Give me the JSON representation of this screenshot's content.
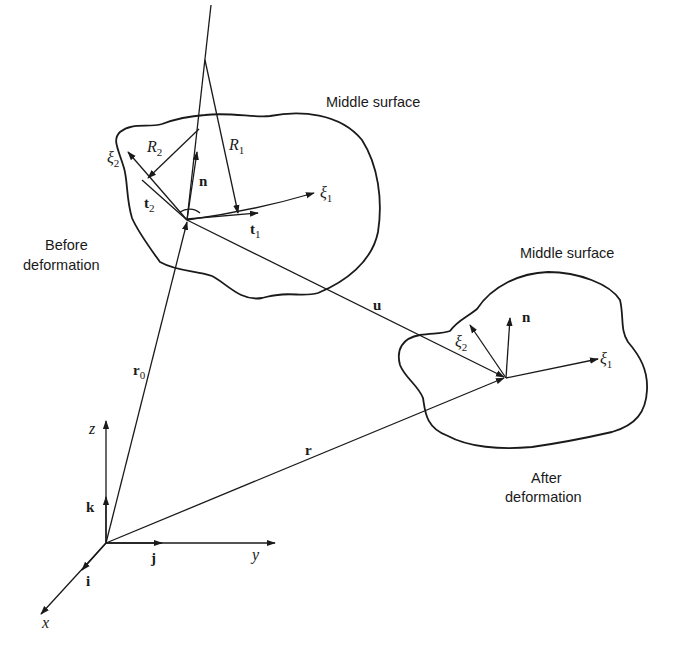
{
  "figure": {
    "labels": {
      "middle_surface_before": "Middle surface",
      "middle_surface_after": "Middle surface",
      "before_line1": "Before",
      "before_line2": "deformation",
      "after_line1": "After",
      "after_line2": "deformation"
    },
    "vectors": {
      "r0": {
        "base": "r",
        "sub": "0"
      },
      "r": {
        "base": "r"
      },
      "u": {
        "base": "u"
      },
      "n_before": {
        "base": "n"
      },
      "n_after": {
        "base": "n"
      },
      "t1": {
        "base": "t",
        "sub": "1"
      },
      "t2": {
        "base": "t",
        "sub": "2"
      },
      "xi1_before": {
        "base": "ξ",
        "sub": "1"
      },
      "xi2_before": {
        "base": "ξ",
        "sub": "2"
      },
      "xi1_after": {
        "base": "ξ",
        "sub": "1"
      },
      "xi2_after": {
        "base": "ξ",
        "sub": "2"
      },
      "R1": {
        "base": "R",
        "sub": "1"
      },
      "R2": {
        "base": "R",
        "sub": "2"
      }
    },
    "axes": {
      "x": "x",
      "y": "y",
      "z": "z",
      "i": "i",
      "j": "j",
      "k": "k"
    },
    "colors": {
      "ink": "#1a1a1a",
      "paper": "#ffffff"
    }
  }
}
